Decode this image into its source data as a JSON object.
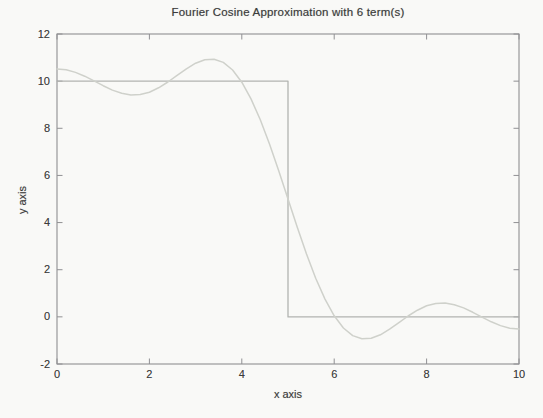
{
  "colors": {
    "background": "#f9f9f7",
    "axis_lines": "#909093",
    "text": "#3c3c3c",
    "step_line": "#b2b4b1",
    "approximation_curve": "#cfd1cb"
  },
  "chart_data": {
    "type": "line",
    "title": "Fourier Cosine Approximation with 6 term(s)",
    "xlabel": "x axis",
    "ylabel": "y axis",
    "xlim": [
      0,
      10
    ],
    "ylim": [
      -2,
      12
    ],
    "x_ticks": [
      0,
      2,
      4,
      6,
      8,
      10
    ],
    "y_ticks": [
      -2,
      0,
      2,
      4,
      6,
      8,
      10,
      12
    ],
    "grid": false,
    "legend": "none",
    "series": [
      {
        "name": "target-step-function",
        "description": "square wave: y=10 for 0<x<5, y=0 for 5<x<10",
        "color_key": "step_line",
        "stroke_width": 1.3,
        "points": [
          [
            0,
            10
          ],
          [
            5,
            10
          ],
          [
            5,
            0
          ],
          [
            10,
            0
          ]
        ]
      },
      {
        "name": "fourier-cosine-approximation",
        "description": "partial sum 5 + (20/pi)[cos(pi x/10) - cos(3pi x/10)/3 + cos(5pi x/10)/5]",
        "color_key": "approximation_curve",
        "stroke_width": 1.5,
        "x": [
          0,
          0.2,
          0.4,
          0.6,
          0.8,
          1,
          1.2,
          1.4,
          1.6,
          1.8,
          2,
          2.2,
          2.4,
          2.6,
          2.8,
          3,
          3.2,
          3.4,
          3.6,
          3.8,
          4,
          4.2,
          4.4,
          4.6,
          4.8,
          5,
          5.2,
          5.4,
          5.6,
          5.8,
          6,
          6.2,
          6.4,
          6.6,
          6.8,
          7,
          7.2,
          7.4,
          7.6,
          7.8,
          8,
          8.2,
          8.4,
          8.6,
          8.8,
          9,
          9.2,
          9.4,
          9.6,
          9.8,
          10
        ],
        "y": [
          10.517,
          10.48,
          10.373,
          10.21,
          10.013,
          9.807,
          9.622,
          9.484,
          9.415,
          9.43,
          9.533,
          9.717,
          9.963,
          10.244,
          10.524,
          10.76,
          10.91,
          10.933,
          10.796,
          10.474,
          9.957,
          9.247,
          8.36,
          7.328,
          6.191,
          5.0,
          3.809,
          2.672,
          1.64,
          0.753,
          0.043,
          -0.474,
          -0.796,
          -0.933,
          -0.91,
          -0.76,
          -0.524,
          -0.244,
          0.037,
          0.283,
          0.467,
          0.57,
          0.585,
          0.516,
          0.378,
          0.193,
          -0.013,
          -0.21,
          -0.373,
          -0.48,
          -0.517
        ]
      }
    ]
  }
}
